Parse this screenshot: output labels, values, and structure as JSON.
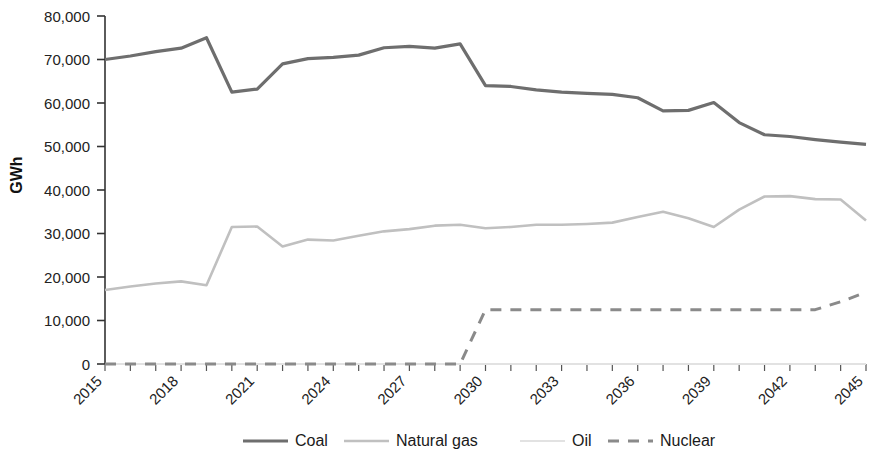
{
  "chart_data": {
    "type": "line",
    "title": "",
    "xlabel": "",
    "ylabel": "GWh",
    "ylim": [
      0,
      80000
    ],
    "xlim": [
      2015,
      2045
    ],
    "grid": false,
    "legend_position": "bottom",
    "ytick_labels": [
      "80,000",
      "70,000",
      "60,000",
      "50,000",
      "40,000",
      "30,000",
      "20,000",
      "10,000",
      "0"
    ],
    "ytick_values": [
      80000,
      70000,
      60000,
      50000,
      40000,
      30000,
      20000,
      10000,
      0
    ],
    "x": [
      2015,
      2016,
      2017,
      2018,
      2019,
      2020,
      2021,
      2022,
      2023,
      2024,
      2025,
      2026,
      2027,
      2028,
      2029,
      2030,
      2031,
      2032,
      2033,
      2034,
      2035,
      2036,
      2037,
      2038,
      2039,
      2040,
      2041,
      2042,
      2043,
      2044,
      2045
    ],
    "xtick_labels": [
      "2015",
      "2018",
      "2021",
      "2024",
      "2027",
      "2030",
      "2033",
      "2036",
      "2039",
      "2042",
      "2045"
    ],
    "xtick_values": [
      2015,
      2018,
      2021,
      2024,
      2027,
      2030,
      2033,
      2036,
      2039,
      2042,
      2045
    ],
    "series": [
      {
        "name": "Coal",
        "color": "#6e6e6e",
        "width": 3.2,
        "dash": "none",
        "values": [
          70000,
          70800,
          71800,
          72600,
          75000,
          62500,
          63200,
          69000,
          70200,
          70500,
          71000,
          72700,
          73000,
          72600,
          73600,
          64000,
          63800,
          63000,
          62500,
          62200,
          62000,
          61200,
          58200,
          58300,
          60100,
          55500,
          52700,
          52300,
          51600,
          51000,
          50500
        ]
      },
      {
        "name": "Natural gas",
        "color": "#c0c0c0",
        "width": 2.6,
        "dash": "none",
        "values": [
          17000,
          17800,
          18500,
          19000,
          18100,
          31500,
          31600,
          27000,
          28600,
          28400,
          29500,
          30500,
          31000,
          31800,
          32000,
          31200,
          31500,
          32000,
          32000,
          32200,
          32500,
          33800,
          35000,
          33500,
          31500,
          35500,
          38500,
          38600,
          37900,
          37800,
          33000
        ]
      },
      {
        "name": "Oil",
        "color": "#e2e2e2",
        "width": 2.0,
        "dash": "none",
        "values": [
          0,
          0,
          0,
          0,
          0,
          0,
          0,
          0,
          0,
          0,
          0,
          0,
          0,
          0,
          0,
          0,
          0,
          0,
          0,
          0,
          0,
          0,
          0,
          0,
          0,
          0,
          0,
          0,
          0,
          0,
          0
        ]
      },
      {
        "name": "Nuclear",
        "color": "#8a8a8a",
        "width": 3.0,
        "dash": "11,9",
        "values": [
          0,
          0,
          0,
          0,
          0,
          0,
          0,
          0,
          0,
          0,
          0,
          0,
          0,
          0,
          0,
          12500,
          12500,
          12500,
          12500,
          12500,
          12500,
          12500,
          12500,
          12500,
          12500,
          12500,
          12500,
          12500,
          12500,
          14300,
          16500
        ]
      }
    ]
  },
  "legend": {
    "items": [
      {
        "label": "Coal"
      },
      {
        "label": "Natural gas"
      },
      {
        "label": "Oil"
      },
      {
        "label": "Nuclear"
      }
    ]
  }
}
